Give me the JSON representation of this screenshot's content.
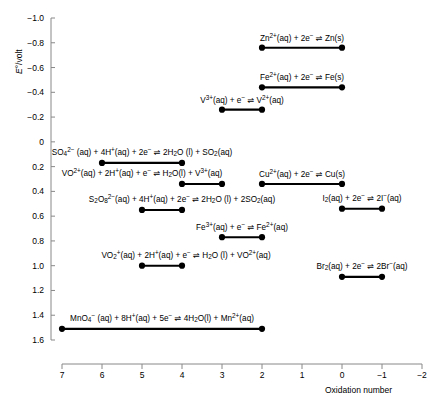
{
  "chart_data": {
    "type": "scatter",
    "title": "",
    "xlabel": "Oxidation number",
    "ylabel": "E°/volt",
    "xlim": [
      7,
      -2
    ],
    "ylim": [
      1.6,
      -1.0
    ],
    "x_ticks": [
      "7",
      "6",
      "5",
      "4",
      "3",
      "2",
      "1",
      "0",
      "−1",
      "−2"
    ],
    "x_tick_values": [
      7,
      6,
      5,
      4,
      3,
      2,
      1,
      0,
      -1,
      -2
    ],
    "y_ticks": [
      "−1.0",
      "−0.8",
      "−0.6",
      "−0.4",
      "−0.2",
      "0",
      "0.2",
      "0.4",
      "0.6",
      "0.8",
      "1.0",
      "1.2",
      "1.4",
      "1.6"
    ],
    "y_tick_values": [
      -1.0,
      -0.8,
      -0.6,
      -0.4,
      -0.2,
      0,
      0.2,
      0.4,
      0.6,
      0.8,
      1.0,
      1.2,
      1.4,
      1.6
    ],
    "grid": false,
    "legend": "none",
    "y_axis_inverted": true,
    "x_axis_inverted": true,
    "series_name": "standard electrode potentials",
    "marker": "filled-circle",
    "line_color": "#000000",
    "segments": [
      {
        "label": "Zn<sup>2+</sup>(aq) + 2e<sup>−</sup> ⇌ Zn(s)",
        "x_start": 2,
        "x_end": 0,
        "e": -0.76,
        "label_x": 1.0
      },
      {
        "label": "Fe<sup>2+</sup>(aq) + 2e<sup>−</sup> ⇌ Fe(s)",
        "x_start": 2,
        "x_end": 0,
        "e": -0.44,
        "label_x": 1.0
      },
      {
        "label": "V<sup>3+</sup>(aq) + e<sup>−</sup> ⇌ V<sup>2+</sup>(aq)",
        "x_start": 3,
        "x_end": 2,
        "e": -0.26,
        "label_x": 2.5
      },
      {
        "label": "SO<sub>4</sub><sup>2−</sup> (aq) + 4H<sup>+</sup>(aq) + 2e<sup>−</sup> ⇌ 2H<sub>2</sub>O (l) + SO<sub>2</sub>(aq)",
        "x_start": 6,
        "x_end": 4,
        "e": 0.17,
        "label_x": 5.0
      },
      {
        "label": "VO<sup>2+</sup>(aq) + 2H<sup>+</sup>(aq) + e<sup>−</sup> ⇌ H<sub>2</sub>O(l) + V<sup>3+</sup>(aq)",
        "x_start": 4,
        "x_end": 3,
        "e": 0.34,
        "label_x": 5.0
      },
      {
        "label": "Cu<sup>2+</sup>(aq) + 2e<sup>−</sup> ⇌ Cu(s)",
        "x_start": 2,
        "x_end": 0,
        "e": 0.34,
        "label_x": 1.0
      },
      {
        "label": "S<sub>2</sub>O<sub>8</sub><sup>2−</sup>(aq) + 4H<sup>+</sup>(aq) + 2e<sup>−</sup> ⇌ 2H<sub>2</sub>O (l) + 2SO<sub>2</sub>(aq)",
        "x_start": 5,
        "x_end": 4,
        "e": 0.55,
        "label_x": 4.0
      },
      {
        "label": "I<sub>2</sub>(aq) + 2e<sup>−</sup> ⇌ 2I<sup>−</sup>(aq)",
        "x_start": 0,
        "x_end": -1,
        "e": 0.54,
        "label_x": -0.5
      },
      {
        "label": "Fe<sup>3+</sup>(aq) + e<sup>−</sup> ⇌ Fe<sup>2+</sup>(aq)",
        "x_start": 3,
        "x_end": 2,
        "e": 0.77,
        "label_x": 2.5
      },
      {
        "label": "VO<sub>2</sub><sup>+</sup>(aq) + 2H<sup>+</sup>(aq) + e<sup>−</sup> ⇌ H<sub>2</sub>O (l) + VO<sup>2+</sup>(aq)",
        "x_start": 5,
        "x_end": 4,
        "e": 1.0,
        "label_x": 3.9
      },
      {
        "label": "Br<sub>2</sub>(aq) + 2e<sup>−</sup> ⇌ 2Br<sup>−</sup>(aq)",
        "x_start": 0,
        "x_end": -1,
        "e": 1.09,
        "label_x": -0.5
      },
      {
        "label": "MnO<sub>4</sub><sup>−</sup> (aq) + 8H<sup>+</sup>(aq) + 5e<sup>−</sup> ⇌ 4H<sub>2</sub>O(l) + Mn<sup>2+</sup>(aq)",
        "x_start": 7,
        "x_end": 2,
        "e": 1.51,
        "label_x": 4.5
      }
    ]
  },
  "axes": {
    "y_title": "E°/volt",
    "x_title": "Oxidation number"
  }
}
